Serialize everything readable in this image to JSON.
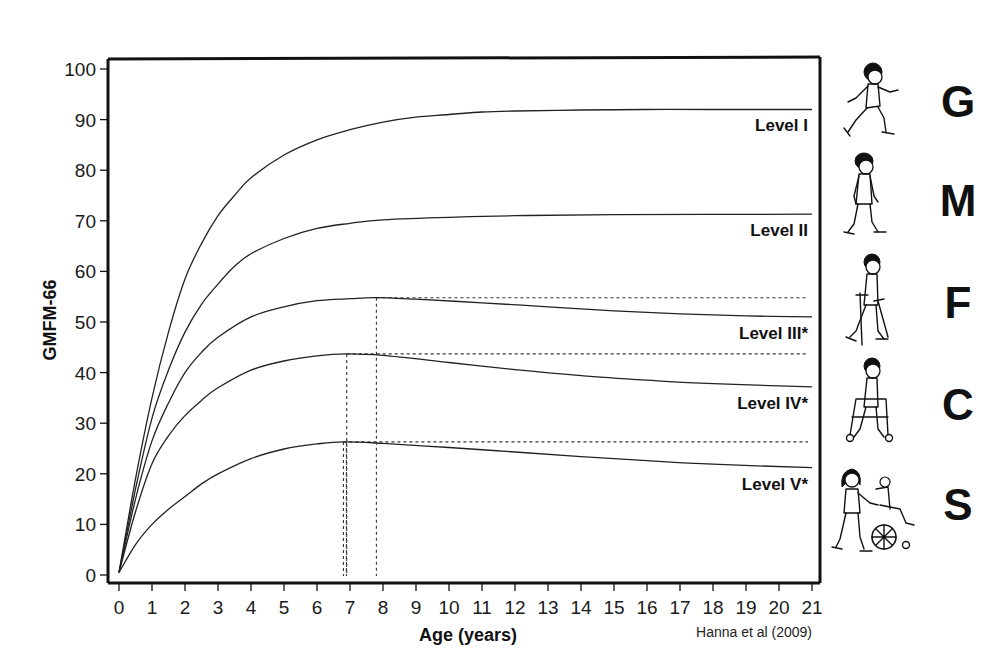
{
  "chart_data": {
    "type": "line",
    "title": "",
    "xlabel": "Age (years)",
    "ylabel": "GMFM-66",
    "xlim": [
      0,
      21
    ],
    "ylim": [
      0,
      100
    ],
    "x_ticks": [
      0,
      1,
      2,
      3,
      4,
      5,
      6,
      7,
      8,
      9,
      10,
      11,
      12,
      13,
      14,
      15,
      16,
      17,
      18,
      19,
      20,
      21
    ],
    "y_ticks": [
      0,
      10,
      20,
      30,
      40,
      50,
      60,
      70,
      80,
      90,
      100
    ],
    "grid": false,
    "legend_position": "inline-right",
    "source": "Hanna et al (2009)",
    "series": [
      {
        "name": "Level I",
        "label": "Level I",
        "points": [
          [
            0,
            0.5
          ],
          [
            0.5,
            19
          ],
          [
            1,
            35
          ],
          [
            1.5,
            48
          ],
          [
            2,
            58.5
          ],
          [
            2.5,
            65.5
          ],
          [
            3,
            71
          ],
          [
            3.5,
            75
          ],
          [
            4,
            78.5
          ],
          [
            5,
            83
          ],
          [
            6,
            86
          ],
          [
            7,
            88
          ],
          [
            8,
            89.5
          ],
          [
            9,
            90.5
          ],
          [
            10,
            91
          ],
          [
            11,
            91.5
          ],
          [
            12,
            91.7
          ],
          [
            14,
            91.9
          ],
          [
            16,
            92
          ],
          [
            18,
            92
          ],
          [
            21,
            92
          ]
        ]
      },
      {
        "name": "Level II",
        "label": "Level II",
        "points": [
          [
            0,
            0.5
          ],
          [
            0.5,
            17
          ],
          [
            1,
            31
          ],
          [
            1.5,
            40.5
          ],
          [
            2,
            48
          ],
          [
            2.5,
            53.5
          ],
          [
            3,
            57.5
          ],
          [
            3.5,
            61
          ],
          [
            4,
            63.5
          ],
          [
            5,
            66.5
          ],
          [
            6,
            68.5
          ],
          [
            7,
            69.5
          ],
          [
            8,
            70.2
          ],
          [
            10,
            70.7
          ],
          [
            12,
            71
          ],
          [
            15,
            71.2
          ],
          [
            21,
            71.3
          ]
        ]
      },
      {
        "name": "Level III",
        "label": "Level III*",
        "peak": {
          "age": 7.8,
          "value": 54.8
        },
        "points": [
          [
            0,
            0.5
          ],
          [
            0.5,
            15
          ],
          [
            1,
            26.5
          ],
          [
            1.5,
            34
          ],
          [
            2,
            40
          ],
          [
            2.5,
            44
          ],
          [
            3,
            47
          ],
          [
            4,
            51
          ],
          [
            5,
            53
          ],
          [
            6,
            54.2
          ],
          [
            7,
            54.6
          ],
          [
            7.8,
            54.8
          ],
          [
            9,
            54.5
          ],
          [
            11,
            53.8
          ],
          [
            13,
            53
          ],
          [
            15,
            52.2
          ],
          [
            17,
            51.6
          ],
          [
            19,
            51.2
          ],
          [
            21,
            51
          ]
        ]
      },
      {
        "name": "Level IV",
        "label": "Level IV*",
        "peak": {
          "age": 6.9,
          "value": 43.7
        },
        "points": [
          [
            0,
            0.5
          ],
          [
            0.5,
            12.5
          ],
          [
            1,
            22
          ],
          [
            1.5,
            27.5
          ],
          [
            2,
            31.5
          ],
          [
            2.5,
            34.5
          ],
          [
            3,
            37
          ],
          [
            4,
            40.5
          ],
          [
            5,
            42.3
          ],
          [
            6,
            43.3
          ],
          [
            6.9,
            43.7
          ],
          [
            8,
            43.4
          ],
          [
            10,
            42
          ],
          [
            12,
            40.6
          ],
          [
            14,
            39.4
          ],
          [
            16,
            38.5
          ],
          [
            18,
            37.8
          ],
          [
            21,
            37.2
          ]
        ]
      },
      {
        "name": "Level V",
        "label": "Level V*",
        "peak": {
          "age": 6.8,
          "value": 26.3
        },
        "points": [
          [
            0,
            0.5
          ],
          [
            0.5,
            6
          ],
          [
            1,
            10
          ],
          [
            1.5,
            13
          ],
          [
            2,
            15.5
          ],
          [
            2.5,
            18
          ],
          [
            3,
            20
          ],
          [
            4,
            23
          ],
          [
            5,
            24.9
          ],
          [
            6,
            25.9
          ],
          [
            6.8,
            26.3
          ],
          [
            8,
            26
          ],
          [
            10,
            25.2
          ],
          [
            12,
            24.3
          ],
          [
            14,
            23.4
          ],
          [
            16,
            22.6
          ],
          [
            18,
            21.9
          ],
          [
            21,
            21.2
          ]
        ]
      }
    ]
  },
  "side_panel": {
    "letters": [
      "G",
      "M",
      "F",
      "C",
      "S"
    ],
    "icons": [
      {
        "name": "child-running-icon",
        "level": "Level I"
      },
      {
        "name": "child-walking-icon",
        "level": "Level II"
      },
      {
        "name": "child-crutches-icon",
        "level": "Level III"
      },
      {
        "name": "child-walker-icon",
        "level": "Level IV"
      },
      {
        "name": "wheelchair-pushed-icon",
        "level": "Level V"
      }
    ]
  }
}
